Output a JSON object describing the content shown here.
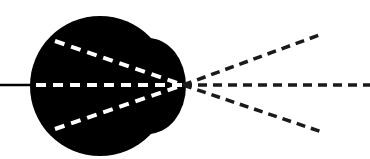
{
  "diagram": {
    "colors": {
      "background": "#ffffff",
      "blob": "#000000",
      "inner_dashes": "#ffffff",
      "outer_dashes": "#1a1a1a",
      "input_line": "#000000"
    },
    "focal_point": {
      "x": 183,
      "y": 85
    },
    "input_line": {
      "x1": 0,
      "y1": 85,
      "x2": 32,
      "y2": 85
    },
    "inner_rays": [
      {
        "x1": 55,
        "y1": 41,
        "x2": 183,
        "y2": 85
      },
      {
        "x1": 36,
        "y1": 85,
        "x2": 183,
        "y2": 85
      },
      {
        "x1": 55,
        "y1": 129,
        "x2": 183,
        "y2": 85
      }
    ],
    "outer_rays": [
      {
        "x1": 183,
        "y1": 85,
        "x2": 322,
        "y2": 34
      },
      {
        "x1": 183,
        "y1": 85,
        "x2": 370,
        "y2": 85
      },
      {
        "x1": 183,
        "y1": 85,
        "x2": 322,
        "y2": 132
      }
    ]
  }
}
